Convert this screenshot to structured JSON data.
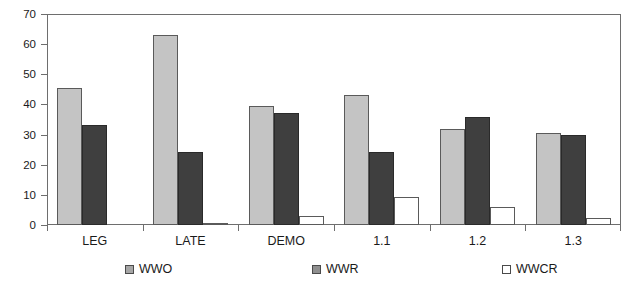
{
  "chart_data": {
    "type": "bar",
    "title": "",
    "subtitle": "",
    "xlabel": "",
    "ylabel": "",
    "ylim": [
      0,
      70
    ],
    "ytick_step": 10,
    "yticks": [
      "0",
      "10",
      "20",
      "30",
      "40",
      "50",
      "60",
      "70"
    ],
    "grid": false,
    "legend_position": "bottom",
    "categories": [
      "LEG",
      "LATE",
      "DEMO",
      "1.1",
      "1.2",
      "1.3"
    ],
    "series": [
      {
        "name": "WWO",
        "color": "#c4c4c4",
        "values": [
          45.5,
          63.0,
          39.5,
          43.0,
          32.0,
          30.5
        ]
      },
      {
        "name": "WWR",
        "color": "#3f3f3f",
        "values": [
          33.3,
          24.2,
          37.0,
          24.2,
          36.0,
          30.0
        ]
      },
      {
        "name": "WWCR",
        "color": "#ffffff",
        "values": [
          0.0,
          0.3,
          3.1,
          9.3,
          5.9,
          2.2
        ]
      }
    ]
  },
  "axes": {
    "y_tick_labels": [
      "0",
      "10",
      "20",
      "30",
      "40",
      "50",
      "60",
      "70"
    ],
    "x_tick_labels": [
      "LEG",
      "LATE",
      "DEMO",
      "1.1",
      "1.2",
      "1.3"
    ]
  },
  "legend": {
    "items": [
      {
        "label": "WWO",
        "swatch": "filled-light-gray"
      },
      {
        "label": "WWR",
        "swatch": "filled-dark-gray"
      },
      {
        "label": "WWCR",
        "swatch": "outlined-white"
      }
    ]
  },
  "colors": {
    "series_wwo": "#c4c4c4",
    "series_wwr": "#3f3f3f",
    "series_wwcr": "#ffffff",
    "axis": "#6e6e6e",
    "text": "#1a1a1a",
    "background": "#ffffff"
  }
}
